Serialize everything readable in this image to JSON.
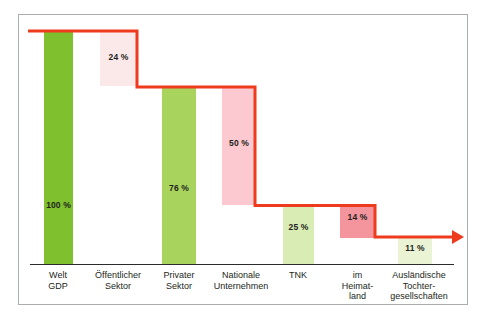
{
  "chart_data": {
    "type": "bar",
    "title": "",
    "subtitle": "",
    "xlabel": "",
    "ylabel": "",
    "ylim": [
      0,
      100
    ],
    "grid": false,
    "legend": null,
    "annotations": [
      "Rote Stufenlinie verbindet die Anteile von 100 % bis 11 %"
    ],
    "categories": [
      "Welt\nGDP",
      "Öffentlicher\nSektor",
      "Privater\nSektor",
      "Nationale\nUnternehmen",
      "TNK",
      "im\nHeimat-\nland",
      "Ausländische\nTochter-\ngesellschaften"
    ],
    "values": [
      100,
      24,
      76,
      50,
      25,
      14,
      11
    ],
    "value_labels": [
      "100 %",
      "24 %",
      "76 %",
      "50 %",
      "25 %",
      "14 %",
      "11 %"
    ],
    "step_levels": [
      100,
      76,
      25,
      11
    ]
  },
  "bars": [
    {
      "name": "bar-welt-gdp",
      "label": "100 %",
      "category": "Welt\nGDP",
      "value": 100,
      "color": "#7ec02d",
      "x": 44,
      "width": 29,
      "top": 30,
      "bottom": 264,
      "label_y": 200,
      "label_color": "#231f20"
    },
    {
      "name": "bar-oeffentlicher-sektor",
      "label": "24 %",
      "category": "Öffentlicher\nSektor",
      "value": 24,
      "color": "#fbe9ea",
      "x": 100,
      "width": 37,
      "top": 30,
      "bottom": 86,
      "label_y": 52,
      "label_color": "#231f20"
    },
    {
      "name": "bar-privater-sektor",
      "label": "76 %",
      "category": "Privater\nSektor",
      "value": 76,
      "color": "#a8d45e",
      "x": 162,
      "width": 34,
      "top": 86,
      "bottom": 264,
      "label_y": 183,
      "label_color": "#231f20"
    },
    {
      "name": "bar-nationale-unternehmen",
      "label": "50 %",
      "category": "Nationale\nUnternehmen",
      "value": 50,
      "color": "#fbc9cf",
      "x": 222,
      "width": 34,
      "top": 86,
      "bottom": 205,
      "label_y": 138,
      "label_color": "#231f20"
    },
    {
      "name": "bar-tnk",
      "label": "25 %",
      "category": "TNK",
      "value": 25,
      "color": "#d9ecb4",
      "x": 283,
      "width": 31,
      "top": 205,
      "bottom": 264,
      "label_y": 222,
      "label_color": "#231f20"
    },
    {
      "name": "bar-im-heimatland",
      "label": "14 %",
      "category": "im\nHeimat-\nland",
      "value": 14,
      "color": "#f4959d",
      "x": 340,
      "width": 35,
      "top": 205,
      "bottom": 238,
      "label_y": 212,
      "label_color": "#231f20"
    },
    {
      "name": "bar-auslaendische-tochtergesellschaften",
      "label": "11 %",
      "category": "Ausländische\nTochter-\ngesellschaften",
      "value": 11,
      "color": "#eaf3d4",
      "x": 398,
      "width": 34,
      "top": 238,
      "bottom": 264,
      "label_y": 243,
      "label_color": "#231f20"
    }
  ],
  "categories_layout": [
    {
      "name": "category-label-welt-gdp",
      "text": "Welt\nGDP",
      "x": 28,
      "width": 60
    },
    {
      "name": "category-label-oeffentlicher-sektor",
      "text": "Öffentlicher\nSektor",
      "x": 87,
      "width": 62
    },
    {
      "name": "category-label-privater-sektor",
      "text": "Privater\nSektor",
      "x": 149,
      "width": 60
    },
    {
      "name": "category-label-nationale-unternehmen",
      "text": "Nationale\nUnternehmen",
      "x": 206,
      "width": 70
    },
    {
      "name": "category-label-tnk",
      "text": "TNK",
      "x": 273,
      "width": 50
    },
    {
      "name": "category-label-im-heimatland",
      "text": "im\nHeimat-\nland",
      "x": 330,
      "width": 55
    },
    {
      "name": "category-label-auslaendische",
      "text": "Ausländische\nTochter-\ngesellschaften",
      "x": 378,
      "width": 82
    }
  ],
  "stepline": {
    "name": "step-connector-line",
    "color": "#ee3b1e",
    "width": 3,
    "points": "28,31 137,31 137,87 255,87 255,205.5 375,205.5 375,237 452,237",
    "arrow": "452,230 464,237 452,244"
  },
  "frame": {
    "border_color": "#b9bcbe",
    "background": "#ffffff"
  },
  "axis": {
    "name": "baseline-axis",
    "color": "#2b2b2b"
  },
  "colors": {
    "accent_red": "#ee3b1e",
    "green_dark": "#7ec02d",
    "green_mid": "#a8d45e",
    "green_light": "#d9ecb4",
    "green_pale": "#eaf3d4",
    "pink_pale": "#fbe9ea",
    "pink_mid": "#fbc9cf",
    "pink_dark": "#f4959d",
    "text": "#231f20"
  }
}
